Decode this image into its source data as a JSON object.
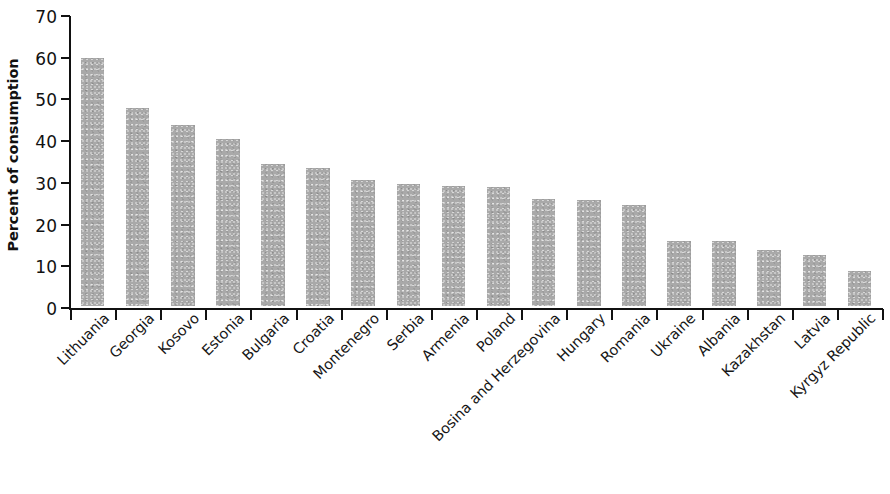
{
  "chart_data": {
    "type": "bar",
    "title": "",
    "subtitle": "",
    "xlabel": "",
    "ylabel": "Percent of consumption",
    "ylim": [
      0,
      70
    ],
    "ytick_values": [
      0,
      10,
      20,
      30,
      40,
      50,
      60,
      70
    ],
    "ytick_labels": [
      "0",
      "10",
      "20",
      "30",
      "40",
      "50",
      "60",
      "70"
    ],
    "grid": false,
    "legend": null,
    "bar_color": "#a9a9a9",
    "axis_color": "#111111",
    "categories": [
      "Lithuania",
      "Georgia",
      "Kosovo",
      "Estonia",
      "Bulgaria",
      "Croatia",
      "Montenegro",
      "Serbia",
      "Armenia",
      "Poland",
      "Bosina and Herzegovina",
      "Hungary",
      "Romania",
      "Ukraine",
      "Albania",
      "Kazakhstan",
      "Latvia",
      "Kyrgyz Republic"
    ],
    "values": [
      59.4,
      47.5,
      43.5,
      40.1,
      34.0,
      33.2,
      30.2,
      29.2,
      28.7,
      28.6,
      25.6,
      25.5,
      24.3,
      15.5,
      15.5,
      13.5,
      12.3,
      8.5
    ]
  }
}
